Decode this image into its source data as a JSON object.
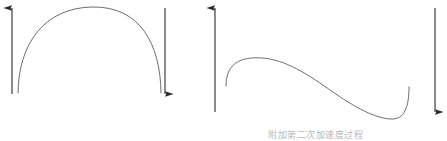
{
  "figure": {
    "width": 447,
    "height": 141,
    "background": "#ffffff",
    "curve_color": "#6e6e6e",
    "arrow_color": "#2b2b2b",
    "caption": "附加第二次加速度过程"
  },
  "panels": [
    {
      "id": "panel-left",
      "name": "arch-panel",
      "curve": {
        "type": "arch",
        "description": "single dome / inverted-U curve rising from lower left to an apex then falling to lower right",
        "start": [
          18,
          93
        ],
        "apex": [
          92,
          7
        ],
        "end": [
          161,
          93
        ]
      },
      "arrows": [
        {
          "id": "left-up-arrow",
          "direction": "up",
          "x": 12,
          "y_top": 7,
          "y_bottom": 94
        },
        {
          "id": "left-down-arrow",
          "direction": "down",
          "x": 165,
          "y_top": 7,
          "y_bottom": 94
        }
      ]
    },
    {
      "id": "panel-right",
      "name": "s-curve-panel",
      "curve": {
        "type": "s-curve",
        "description": "curve rising from lower left to a plateau, descending as an S through the middle, flattening at the bottom then hooking sharply upward at the right end",
        "start": [
          226,
          86
        ],
        "plateau": [
          258,
          58
        ],
        "inflection": [
          330,
          90
        ],
        "trough": [
          392,
          119
        ],
        "end": [
          409,
          87
        ]
      },
      "arrows": [
        {
          "id": "right-up-arrow",
          "direction": "up",
          "x": 215,
          "y_top": 7,
          "y_bottom": 112
        },
        {
          "id": "right-down-arrow",
          "direction": "down",
          "x": 435,
          "y_top": 7,
          "y_bottom": 112
        }
      ]
    }
  ]
}
